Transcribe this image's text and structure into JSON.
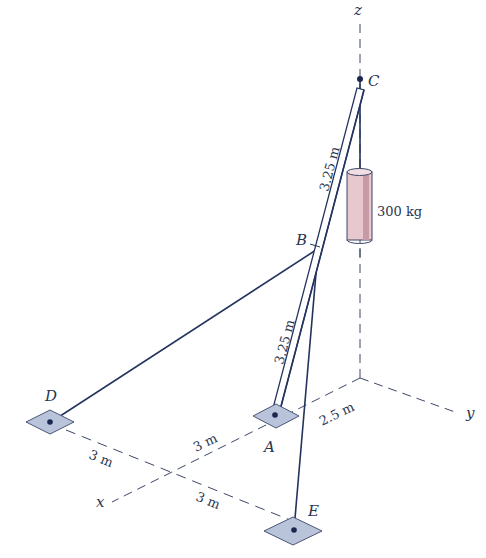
{
  "figure": {
    "axes": {
      "x": "x",
      "y": "y",
      "z": "z"
    },
    "points": {
      "A": "A",
      "B": "B",
      "C": "C",
      "D": "D",
      "E": "E"
    },
    "mass_label": "300 kg",
    "dimensions": {
      "strut_upper": "3.25 m",
      "strut_lower": "3.25 m",
      "origin_to_A": "2.5 m",
      "A_to_x_intersection": "3 m",
      "D_to_intersection": "3 m",
      "intersection_to_E": "3 m"
    },
    "colors": {
      "line": "#23345e",
      "pad_fill": "#b9c3da",
      "mass_fill": "#e8c8cf",
      "text": "#2a3550"
    }
  }
}
